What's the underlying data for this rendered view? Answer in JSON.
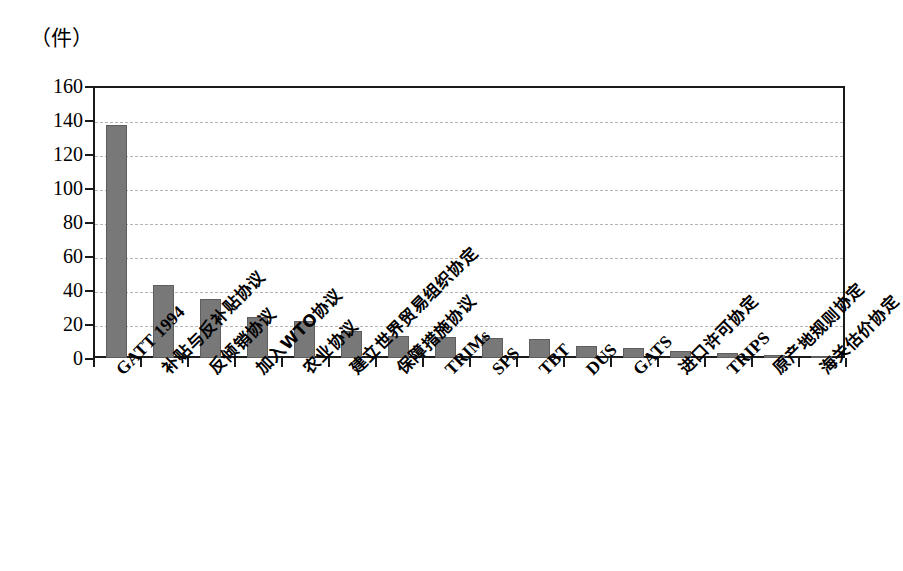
{
  "chart_data": {
    "type": "bar",
    "title": "",
    "subtitle": "",
    "unit_label": "（件）",
    "xlabel": "",
    "ylabel": "件",
    "ylim": [
      0,
      160
    ],
    "ytick_step": 20,
    "yticks": [
      "160",
      "140",
      "120",
      "100",
      "80",
      "60",
      "40",
      "20",
      "0"
    ],
    "grid": true,
    "grid_axis": "y",
    "grid_style": "dashed",
    "legend": false,
    "legend_position": "none",
    "orientation": "vertical",
    "bar_color": "#787878",
    "axis_color": "#1a1a1a",
    "grid_color": "#b4b4b4",
    "background_color": "#ffffff",
    "categories": [
      "GATT 1994",
      "补贴与反补贴协议",
      "反倾销协议",
      "加入WTO协议",
      "农业协议",
      "建立世界贸易组织协定",
      "保障措施协议",
      "TRIMs",
      "SPS",
      "TBT",
      "DUS",
      "GATS",
      "进口许可协定",
      "TRIPS",
      "原产地规则协定",
      "海关估价协定"
    ],
    "category_is_cjk": [
      false,
      true,
      true,
      true,
      true,
      true,
      true,
      false,
      false,
      false,
      false,
      false,
      true,
      false,
      true,
      true
    ],
    "values": [
      137,
      43,
      35,
      24,
      22,
      16,
      13,
      12.5,
      11.5,
      11,
      7,
      6,
      4,
      3,
      2,
      1
    ]
  }
}
